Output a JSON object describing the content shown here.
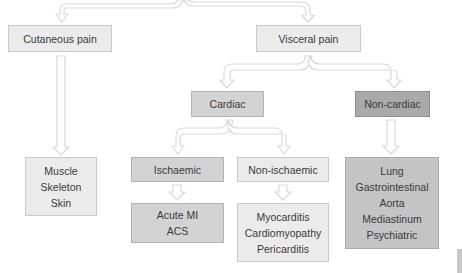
{
  "diagram": {
    "type": "flowchart",
    "root_connector": "Cutaneous pain and Visceral pain (branched from above, off-frame)",
    "nodes": [
      {
        "id": "cutaneous",
        "label": "Cutaneous pain",
        "lines": [
          "Cutaneous pain"
        ],
        "shade": "light"
      },
      {
        "id": "visceral",
        "label": "Visceral pain",
        "lines": [
          "Visceral pain"
        ],
        "shade": "light"
      },
      {
        "id": "cardiac",
        "label": "Cardiac",
        "lines": [
          "Cardiac"
        ],
        "shade": "mid"
      },
      {
        "id": "non_cardiac",
        "label": "Non-cardiac",
        "lines": [
          "Non-cardiac"
        ],
        "shade": "dark"
      },
      {
        "id": "cutaneous_sources",
        "lines": [
          "Muscle",
          "Skeleton",
          "Skin"
        ],
        "shade": "light"
      },
      {
        "id": "ischaemic",
        "label": "Ischaemic",
        "lines": [
          "Ischaemic"
        ],
        "shade": "mid"
      },
      {
        "id": "non_ischaemic",
        "label": "Non-ischaemic",
        "lines": [
          "Non-ischaemic"
        ],
        "shade": "light"
      },
      {
        "id": "ischaemic_causes",
        "lines": [
          "Acute MI",
          "ACS"
        ],
        "shade": "mid"
      },
      {
        "id": "non_ischaemic_causes",
        "lines": [
          "Myocarditis",
          "Cardiomyopathy",
          "Pericarditis"
        ],
        "shade": "light"
      },
      {
        "id": "non_cardiac_causes",
        "lines": [
          "Lung",
          "Gastrointestinal",
          "Aorta",
          "Mediastinum",
          "Psychiatric"
        ],
        "shade": "midplus"
      }
    ],
    "edges": [
      {
        "from": "root",
        "to": "cutaneous"
      },
      {
        "from": "root",
        "to": "visceral"
      },
      {
        "from": "cutaneous",
        "to": "cutaneous_sources"
      },
      {
        "from": "visceral",
        "to": "cardiac"
      },
      {
        "from": "visceral",
        "to": "non_cardiac"
      },
      {
        "from": "cardiac",
        "to": "ischaemic"
      },
      {
        "from": "cardiac",
        "to": "non_ischaemic"
      },
      {
        "from": "ischaemic",
        "to": "ischaemic_causes"
      },
      {
        "from": "non_ischaemic",
        "to": "non_ischaemic_causes"
      },
      {
        "from": "non_cardiac",
        "to": "non_cardiac_causes"
      }
    ]
  },
  "colors": {
    "light_fill": "#ebebeb",
    "mid_fill": "#d3d3d3",
    "midplus_fill": "#c4c4c4",
    "dark_fill": "#a9a9a9",
    "text": "#3a3a3a",
    "arrow_outline": "#d8d8d8"
  }
}
